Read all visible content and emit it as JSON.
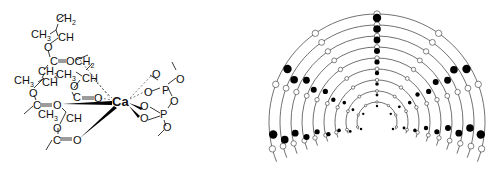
{
  "left_panel": {
    "description": "Calcium ion coordinated by ester carbonyl oxygens of a polymer chain and pyrophosphate oxygens",
    "labels": {
      "ch2_top": "CH",
      "ch3_top": "CH",
      "ch_top": "CH",
      "o1": "O",
      "c1": "C",
      "o_eq1": "O",
      "och2": "OCH",
      "ch2_mid": "CH",
      "ch3_mid": "CH",
      "ch_mid": "CH",
      "ch3_left": "CH",
      "ch_left": "CH",
      "o_left": "O",
      "o_mid": "O",
      "c_mid": "C",
      "o_eq_mid": "O",
      "c_left": "C",
      "o_eq_left": "O",
      "ch3_low": "CH",
      "ch_low": "CH",
      "o_low": "O",
      "c_low": "C",
      "o_eq_low": "O",
      "ca": "Ca",
      "p1": "P",
      "p2": "P",
      "o": "O",
      "sub2": "2",
      "sub3": "3"
    }
  },
  "right_panel": {
    "description": "Schematic of concentric helical arcs with open and filled circles (ion binding sites)",
    "arc_count": 9,
    "filled_color": "#000000",
    "open_color": "#ffffff",
    "line_color": "#333333"
  }
}
